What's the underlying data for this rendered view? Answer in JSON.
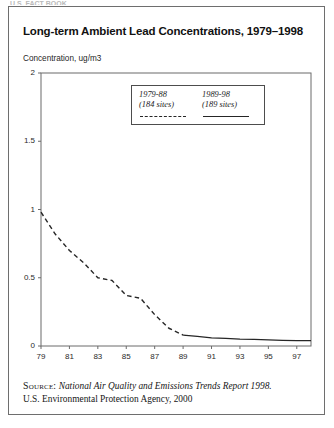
{
  "document": {
    "top_clipped_text": "U.S. FACT BOOK"
  },
  "figure": {
    "title": "Long-term Ambient Lead Concentrations, 1979–1998",
    "y_unit_label": "Concentration, ug/m3",
    "source": {
      "kicker": "Source:",
      "title": "National Air Quality and Emissions Trends Report 1998.",
      "line2": "U.S. Environmental Protection Agency, 2000"
    }
  },
  "legend": {
    "entries": [
      {
        "period": "1979-88",
        "sites": "(184 sites)",
        "style": "dashed"
      },
      {
        "period": "1989-98",
        "sites": "(189 sites)",
        "style": "solid"
      }
    ]
  },
  "chart_data": {
    "type": "line",
    "title": "Long-term Ambient Lead Concentrations, 1979–1998",
    "xlabel": "",
    "ylabel": "Concentration, ug/m3",
    "xlim": [
      1979,
      1998
    ],
    "ylim": [
      0,
      2
    ],
    "yticks": [
      0,
      0.5,
      1,
      1.5,
      2
    ],
    "ytick_labels": [
      "0",
      "0.5",
      "1",
      "1.5",
      "2"
    ],
    "xticks": [
      1979,
      1981,
      1983,
      1985,
      1987,
      1989,
      1991,
      1993,
      1995,
      1997
    ],
    "xtick_labels": [
      "79",
      "81",
      "83",
      "85",
      "87",
      "89",
      "91",
      "93",
      "95",
      "97"
    ],
    "grid": false,
    "legend_position": "top-center",
    "series": [
      {
        "name": "1979-88 (184 sites)",
        "style": "dashed",
        "color": "#262626",
        "x": [
          1979,
          1980,
          1981,
          1982,
          1983,
          1984,
          1985,
          1986,
          1987,
          1988,
          1989
        ],
        "values": [
          0.98,
          0.82,
          0.7,
          0.61,
          0.5,
          0.48,
          0.37,
          0.35,
          0.23,
          0.13,
          0.08
        ]
      },
      {
        "name": "1989-98 (189 sites)",
        "style": "solid",
        "color": "#262626",
        "x": [
          1989,
          1990,
          1991,
          1992,
          1993,
          1994,
          1995,
          1996,
          1997,
          1998
        ],
        "values": [
          0.08,
          0.07,
          0.06,
          0.055,
          0.05,
          0.048,
          0.045,
          0.042,
          0.04,
          0.04
        ]
      }
    ]
  }
}
